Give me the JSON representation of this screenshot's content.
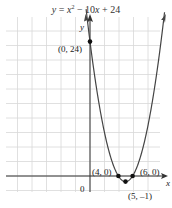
{
  "chart_data": {
    "type": "line",
    "title_parts": {
      "lhs": "y",
      "eq": " = ",
      "x": "x",
      "sup": "2",
      "rest": " − 10",
      "x2": "x",
      "tail": " + 24"
    },
    "xlabel": "x",
    "ylabel": "y",
    "origin_label": "0",
    "function": "x^2 - 10x + 24",
    "xlim": [
      -12,
      10
    ],
    "ylim": [
      -2.5,
      27
    ],
    "grid": true,
    "points": [
      {
        "x": 0,
        "y": 24,
        "label": "(0, 24)"
      },
      {
        "x": 4,
        "y": 0,
        "label": "(4, 0)"
      },
      {
        "x": 6,
        "y": 0,
        "label": "(6, 0)"
      },
      {
        "x": 5,
        "y": -1,
        "label": "(5, –1)"
      }
    ],
    "colors": {
      "grid": "#d8d8d8",
      "axis": "#333333",
      "curve": "#444444",
      "point": "#111111"
    }
  }
}
